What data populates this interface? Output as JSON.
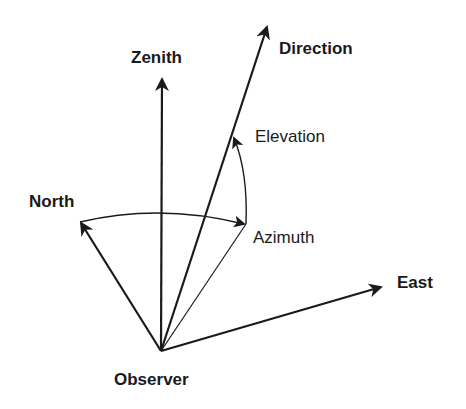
{
  "diagram": {
    "title": "",
    "labels": {
      "zenith": "Zenith",
      "direction": "Direction",
      "elevation": "Elevation",
      "north": "North",
      "azimuth": "Azimuth",
      "east": "East",
      "observer": "Observer"
    },
    "colors": {
      "stroke": "#1a1a1a",
      "background": "#ffffff"
    },
    "points": {
      "observer": [
        161,
        351
      ],
      "zenith_tip": [
        162,
        77
      ],
      "direction_tip": [
        268,
        24
      ],
      "north_tip": [
        79,
        221
      ],
      "east_tip": [
        383,
        286
      ],
      "azimuth_tip": [
        246,
        224
      ],
      "elevation_tip": [
        234,
        137
      ]
    }
  }
}
